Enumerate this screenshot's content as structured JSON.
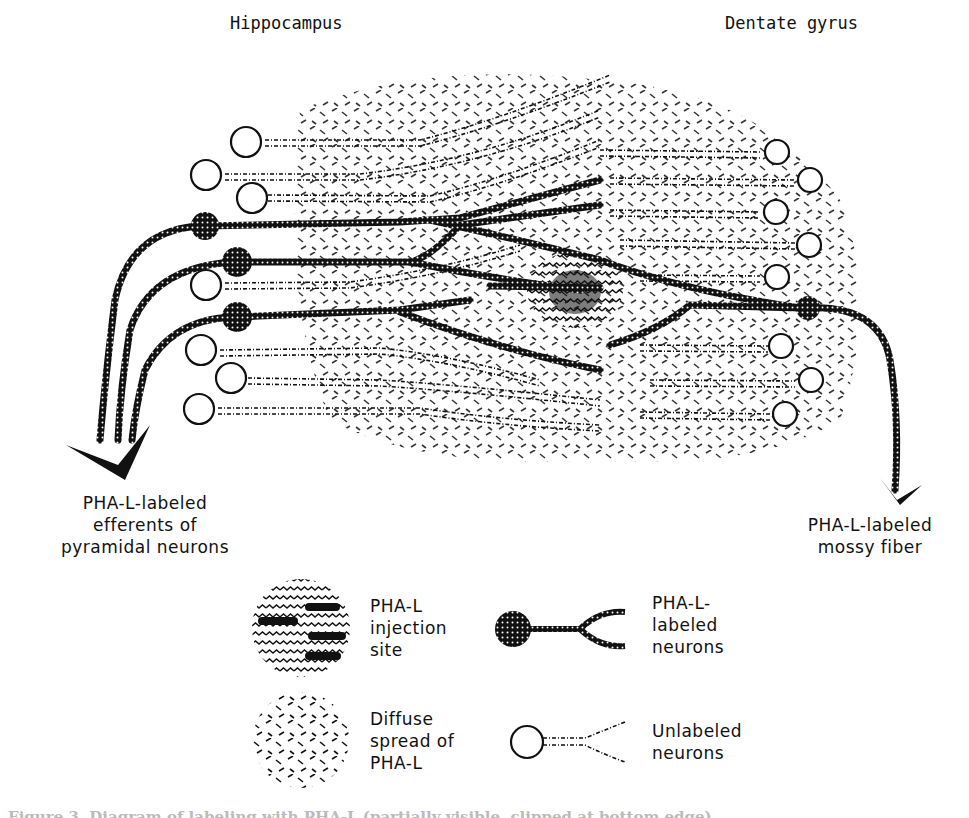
{
  "figure": {
    "region_labels": {
      "left": "Hippocampus",
      "right": "Dentate gyrus"
    },
    "annotations": {
      "left_arrow": [
        "PHA-L-labeled",
        "efferents of",
        "pyramidal neurons"
      ],
      "right_arrow": [
        "PHA-L-labeled",
        "mossy fiber"
      ]
    },
    "legend": [
      {
        "icon": "injection-site-icon",
        "lines": [
          "PHA-L",
          "injection",
          "site"
        ]
      },
      {
        "icon": "labeled-neuron-icon",
        "lines": [
          "PHA-L-",
          "labeled",
          "neurons"
        ]
      },
      {
        "icon": "diffuse-spread-icon",
        "lines": [
          "Diffuse",
          "spread of",
          "PHA-L"
        ]
      },
      {
        "icon": "unlabeled-neuron-icon",
        "lines": [
          "Unlabeled",
          "neurons"
        ]
      }
    ],
    "caption": "Figure 3. Diagram of labeling with PHA-L (partially visible, clipped at bottom edge)",
    "colors": {
      "ink": "#111111",
      "background": "#ffffff"
    }
  }
}
